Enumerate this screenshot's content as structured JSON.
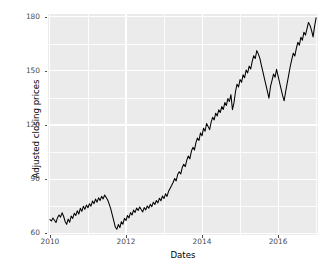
{
  "chart_data": {
    "type": "line",
    "title": "",
    "xlabel": "Dates",
    "ylabel": "Adjusted closing prices",
    "xlim": [
      2009.95,
      2017.05
    ],
    "ylim": [
      59.0,
      181.5
    ],
    "xticks": [
      2010,
      2012,
      2014,
      2016
    ],
    "xtick_labels": [
      "2010",
      "2012",
      "2014",
      "2016"
    ],
    "yticks": [
      60,
      90,
      120,
      150,
      180
    ],
    "ytick_labels": [
      "60",
      "90",
      "120",
      "150",
      "180"
    ],
    "xminor": [
      2011,
      2013,
      2015,
      2017
    ],
    "yminor": [
      75,
      105,
      135,
      165
    ],
    "grid": true,
    "legend": null,
    "line_color": "#000000",
    "panel_background": "#ebebeb",
    "gridline_color": "#ffffff",
    "series": [
      {
        "name": "Adjusted closing price",
        "x": [
          2010.0,
          2010.04,
          2010.08,
          2010.12,
          2010.16,
          2010.2,
          2010.24,
          2010.28,
          2010.32,
          2010.36,
          2010.4,
          2010.44,
          2010.48,
          2010.52,
          2010.56,
          2010.6,
          2010.64,
          2010.68,
          2010.72,
          2010.76,
          2010.8,
          2010.84,
          2010.88,
          2010.92,
          2010.96,
          2011.0,
          2011.04,
          2011.08,
          2011.12,
          2011.16,
          2011.2,
          2011.24,
          2011.28,
          2011.32,
          2011.36,
          2011.4,
          2011.44,
          2011.48,
          2011.52,
          2011.56,
          2011.6,
          2011.64,
          2011.68,
          2011.72,
          2011.76,
          2011.8,
          2011.84,
          2011.88,
          2011.92,
          2011.96,
          2012.0,
          2012.04,
          2012.08,
          2012.12,
          2012.16,
          2012.2,
          2012.24,
          2012.28,
          2012.32,
          2012.36,
          2012.4,
          2012.44,
          2012.48,
          2012.52,
          2012.56,
          2012.6,
          2012.64,
          2012.68,
          2012.72,
          2012.76,
          2012.8,
          2012.84,
          2012.88,
          2012.92,
          2012.96,
          2013.0,
          2013.04,
          2013.08,
          2013.12,
          2013.16,
          2013.2,
          2013.24,
          2013.28,
          2013.32,
          2013.36,
          2013.4,
          2013.44,
          2013.48,
          2013.52,
          2013.56,
          2013.6,
          2013.64,
          2013.68,
          2013.72,
          2013.76,
          2013.8,
          2013.84,
          2013.88,
          2013.92,
          2013.96,
          2014.0,
          2014.04,
          2014.08,
          2014.12,
          2014.16,
          2014.2,
          2014.24,
          2014.28,
          2014.32,
          2014.36,
          2014.4,
          2014.44,
          2014.48,
          2014.52,
          2014.56,
          2014.6,
          2014.64,
          2014.68,
          2014.72,
          2014.76,
          2014.8,
          2014.84,
          2014.88,
          2014.92,
          2014.96,
          2015.0,
          2015.04,
          2015.08,
          2015.12,
          2015.16,
          2015.2,
          2015.24,
          2015.28,
          2015.32,
          2015.36,
          2015.4,
          2015.44,
          2015.48,
          2015.52,
          2015.56,
          2015.6,
          2015.64,
          2015.68,
          2015.72,
          2015.76,
          2015.8,
          2015.84,
          2015.88,
          2015.92,
          2015.96,
          2016.0,
          2016.04,
          2016.08,
          2016.12,
          2016.16,
          2016.2,
          2016.24,
          2016.28,
          2016.32,
          2016.36,
          2016.4,
          2016.44,
          2016.48,
          2016.52,
          2016.56,
          2016.6,
          2016.64,
          2016.68,
          2016.72,
          2016.76,
          2016.8,
          2016.84,
          2016.88,
          2016.92,
          2016.96,
          2017.0
        ],
        "y": [
          67.5,
          66.8,
          68.4,
          67.2,
          65.9,
          68.6,
          70.1,
          68.9,
          71.3,
          69.4,
          66.5,
          64.9,
          67.8,
          66.1,
          69.5,
          68.2,
          71.0,
          69.8,
          72.4,
          70.6,
          73.8,
          72.1,
          74.9,
          73.2,
          75.6,
          74.1,
          76.3,
          75.0,
          77.8,
          76.4,
          78.9,
          77.2,
          79.6,
          78.1,
          80.4,
          79.0,
          81.2,
          79.8,
          78.4,
          76.1,
          73.5,
          70.2,
          66.8,
          63.4,
          62.2,
          64.8,
          63.1,
          66.4,
          65.0,
          68.2,
          67.0,
          69.8,
          68.5,
          71.4,
          70.1,
          72.8,
          71.5,
          73.9,
          72.6,
          74.5,
          73.1,
          71.8,
          74.2,
          72.9,
          75.1,
          73.8,
          76.0,
          74.7,
          77.2,
          75.9,
          78.1,
          76.8,
          79.4,
          78.0,
          80.6,
          79.2,
          81.8,
          80.4,
          83.2,
          84.8,
          86.4,
          88.1,
          90.3,
          89.0,
          92.5,
          94.1,
          92.8,
          96.4,
          98.2,
          96.9,
          100.5,
          102.8,
          101.2,
          105.4,
          107.6,
          106.1,
          110.2,
          112.8,
          111.4,
          115.6,
          114.0,
          118.2,
          116.5,
          120.8,
          119.2,
          117.4,
          121.6,
          124.2,
          122.8,
          126.5,
          125.0,
          128.4,
          126.9,
          130.2,
          128.6,
          132.4,
          130.8,
          134.6,
          133.0,
          136.8,
          128.5,
          132.2,
          138.4,
          142.6,
          141.0,
          145.2,
          143.6,
          147.8,
          146.2,
          150.4,
          148.8,
          152.6,
          151.0,
          155.2,
          158.4,
          156.8,
          161.2,
          159.4,
          157.0,
          153.2,
          149.6,
          145.8,
          142.2,
          138.6,
          134.8,
          141.2,
          144.6,
          148.2,
          146.4,
          150.8,
          147.2,
          143.5,
          139.8,
          136.2,
          133.4,
          138.6,
          143.2,
          147.8,
          152.4,
          156.2,
          159.8,
          158.2,
          162.4,
          165.8,
          164.2,
          168.6,
          167.0,
          171.4,
          169.8,
          173.2,
          176.8,
          175.2,
          172.4,
          168.8,
          174.6,
          179.4
        ]
      }
    ]
  },
  "axis": {
    "y_label": "Adjusted closing prices",
    "x_label": "Dates"
  }
}
